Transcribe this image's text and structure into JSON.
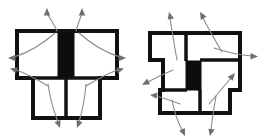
{
  "document": {
    "title": "Two-part sectional outline diagram with flow arrows",
    "background_color": "#ffffff",
    "width": 267,
    "height": 138
  },
  "style": {
    "outline_color": "#111111",
    "fill_white": "#ffffff",
    "fill_black": "#0d0d0d",
    "arrow_color": "#8a8a8a",
    "arrow_head_color": "#6f6f6f",
    "outline_stroke_width": 4,
    "divider_stroke_width": 3.5,
    "arrow_stroke_width": 1.1
  },
  "figures": [
    {
      "id": "figure-left",
      "name": "left-sectional-figure",
      "description": "T-shaped block: wide upper rectangle split by a solid black central bar, with a narrower lower rectangle divided into two cells",
      "outline_points": "17,31 17,78 33,78 33,118 100,118 100,78 117,78 117,31",
      "parts": [
        {
          "id": "upper-left-cell",
          "name": "upper-left-cell",
          "fill": "white"
        },
        {
          "id": "upper-center-bar",
          "name": "upper-center-black-bar",
          "fill": "black"
        },
        {
          "id": "upper-right-cell",
          "name": "upper-right-cell",
          "fill": "white"
        },
        {
          "id": "lower-left-cell",
          "name": "lower-left-cell",
          "fill": "white"
        },
        {
          "id": "lower-right-cell",
          "name": "lower-right-cell",
          "fill": "white"
        }
      ],
      "arrows": [
        {
          "id": "arrow-top-left",
          "name": "flow-arrow-up-left",
          "direction": "up"
        },
        {
          "id": "arrow-top-right",
          "name": "flow-arrow-up-right",
          "direction": "up"
        },
        {
          "id": "arrow-side-upper-left",
          "name": "flow-arrow-left-upper",
          "direction": "left"
        },
        {
          "id": "arrow-side-upper-right",
          "name": "flow-arrow-right-upper",
          "direction": "right"
        },
        {
          "id": "arrow-side-lower-left",
          "name": "flow-arrow-left-lower",
          "direction": "left"
        },
        {
          "id": "arrow-side-lower-right",
          "name": "flow-arrow-right-lower",
          "direction": "right"
        },
        {
          "id": "arrow-bottom-left",
          "name": "flow-arrow-down-left",
          "direction": "down"
        },
        {
          "id": "arrow-bottom-right",
          "name": "flow-arrow-down-right",
          "direction": "down"
        }
      ]
    },
    {
      "id": "figure-right",
      "name": "right-sectional-figure",
      "description": "Stepped block: upper band notched on both sides, solid black bar at the centre, lower rectangle divided into two cells",
      "outline_points": "150,33 150,60 163,60 163,90 160,90 160,113 230,113 230,90 240,90 240,60 240,33",
      "parts": [
        {
          "id": "upper-left-band",
          "name": "upper-left-band-cell",
          "fill": "white"
        },
        {
          "id": "upper-right-band",
          "name": "upper-right-band-cell",
          "fill": "white"
        },
        {
          "id": "center-black-bar",
          "name": "center-black-bar",
          "fill": "black"
        },
        {
          "id": "lower-left-cell-r",
          "name": "lower-left-cell",
          "fill": "white"
        },
        {
          "id": "lower-right-cell-r",
          "name": "lower-right-cell",
          "fill": "white"
        }
      ],
      "arrows": [
        {
          "id": "r-arrow-top-left",
          "name": "flow-arrow-up-left",
          "direction": "up"
        },
        {
          "id": "r-arrow-top-right",
          "name": "flow-arrow-up-right",
          "direction": "up"
        },
        {
          "id": "r-arrow-right-upper",
          "name": "flow-arrow-right-upper",
          "direction": "right"
        },
        {
          "id": "r-arrow-right-lower",
          "name": "flow-arrow-right-lower",
          "direction": "right"
        },
        {
          "id": "r-arrow-left-upper",
          "name": "flow-arrow-left-upper",
          "direction": "left"
        },
        {
          "id": "r-arrow-left-lower",
          "name": "flow-arrow-left-lower",
          "direction": "left"
        },
        {
          "id": "r-arrow-bottom-left",
          "name": "flow-arrow-down-left",
          "direction": "down"
        },
        {
          "id": "r-arrow-bottom-right",
          "name": "flow-arrow-down-right",
          "direction": "down"
        }
      ]
    }
  ]
}
